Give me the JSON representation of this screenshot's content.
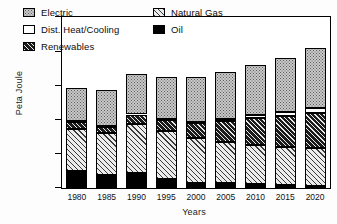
{
  "chart_data": {
    "type": "bar",
    "subtype": "stacked-bar",
    "title": "",
    "xlabel": "Years",
    "ylabel": "Peta Joule",
    "categories": [
      "1980",
      "1985",
      "1990",
      "1995",
      "2000",
      "2005",
      "2010",
      "2015",
      "2020"
    ],
    "ylim": [
      0,
      25000
    ],
    "yticks": [
      0,
      5000,
      10000,
      15000,
      20000,
      25000
    ],
    "ytick_labels": [
      "0",
      "5000",
      "10000",
      "15000",
      "20000",
      "25000"
    ],
    "grid": false,
    "legend_position": "upper-left-inside",
    "stack_order_bottom_to_top": [
      "Oil",
      "Natural Gas",
      "Renewables",
      "Dist. Heat/Cooling",
      "Electric"
    ],
    "series": [
      {
        "name": "Oil",
        "pattern": "solid-black",
        "color": "#000000",
        "values": [
          2450,
          1850,
          2150,
          1350,
          700,
          750,
          600,
          450,
          300
        ]
      },
      {
        "name": "Natural Gas",
        "pattern": "diagonal-hatch",
        "color": "#ececec",
        "values": [
          6200,
          6200,
          7250,
          7000,
          6600,
          6000,
          5650,
          5600,
          5600
        ]
      },
      {
        "name": "Renewables",
        "pattern": "dense-dark-hatch",
        "color": "#1b1b1b",
        "values": [
          1000,
          900,
          1350,
          1600,
          2150,
          3050,
          4000,
          4450,
          5050
        ]
      },
      {
        "name": "Dist. Heat/Cooling",
        "pattern": "empty-white",
        "color": "#ffffff",
        "values": [
          100,
          100,
          100,
          200,
          250,
          250,
          450,
          550,
          700
        ]
      },
      {
        "name": "Electric",
        "pattern": "stipple-dots",
        "color": "#c9c9c9",
        "values": [
          4850,
          5300,
          5850,
          6050,
          6500,
          6900,
          7250,
          7950,
          8750
        ]
      }
    ],
    "totals": [
      14600,
      14350,
      16700,
      16200,
      16200,
      16950,
      17950,
      19000,
      20400
    ]
  },
  "legend": {
    "items": [
      {
        "label": "Electric",
        "pattern": "stipple-dots"
      },
      {
        "label": "Natural Gas",
        "pattern": "diagonal-hatch"
      },
      {
        "label": "Dist. Heat/Cooling",
        "pattern": "empty-white"
      },
      {
        "label": "Oil",
        "pattern": "solid-black"
      },
      {
        "label": "Renewables",
        "pattern": "dense-dark-hatch"
      }
    ]
  }
}
